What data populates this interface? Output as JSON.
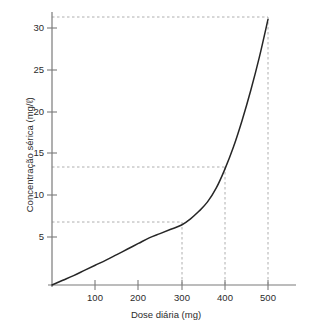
{
  "chart_data": {
    "type": "line",
    "title": "",
    "xlabel": "Dose diária (mg)",
    "ylabel": "Concentração sérica (mg/ℓ)",
    "xlim": [
      0,
      560
    ],
    "ylim": [
      0,
      32.5
    ],
    "grid": false,
    "legend": null,
    "xticks": [
      100,
      200,
      300,
      400,
      500
    ],
    "xtick_labels": [
      "100",
      "200",
      "300",
      "400",
      "500"
    ],
    "yticks": [
      5,
      10,
      15,
      20,
      25,
      30
    ],
    "ytick_labels": [
      "5",
      "10",
      "15",
      "20",
      "25",
      "30"
    ],
    "series": [
      {
        "name": "Concentração sérica",
        "color": "#262626",
        "x": [
          0,
          25,
          50,
          75,
          100,
          125,
          150,
          175,
          200,
          225,
          250,
          275,
          300,
          320,
          340,
          360,
          380,
          400,
          420,
          440,
          460,
          480,
          500
        ],
        "y": [
          0,
          0.55,
          1.1,
          1.7,
          2.3,
          2.9,
          3.55,
          4.2,
          4.85,
          5.5,
          6.0,
          6.5,
          7.0,
          7.7,
          8.6,
          9.7,
          11.3,
          13.5,
          16.1,
          19.2,
          22.7,
          26.6,
          31.0
        ]
      }
    ],
    "guide_lines": [
      {
        "x": 300,
        "y": 7.0,
        "style": "dashed",
        "color": "#9a9a9a"
      },
      {
        "x": 400,
        "y": 13.5,
        "style": "dashed",
        "color": "#9a9a9a"
      },
      {
        "x": 500,
        "y": 31.0,
        "style": "dashed",
        "color": "#9a9a9a"
      }
    ],
    "axis_color": "#7a7a7a",
    "curve_color": "#262626"
  }
}
